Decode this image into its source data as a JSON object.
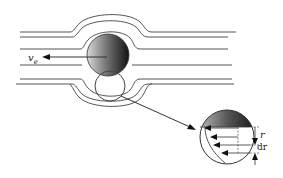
{
  "diagram": {
    "labels": {
      "velocity": "v",
      "velocity_sub": "e",
      "radius": "r",
      "increment": "dr"
    }
  }
}
